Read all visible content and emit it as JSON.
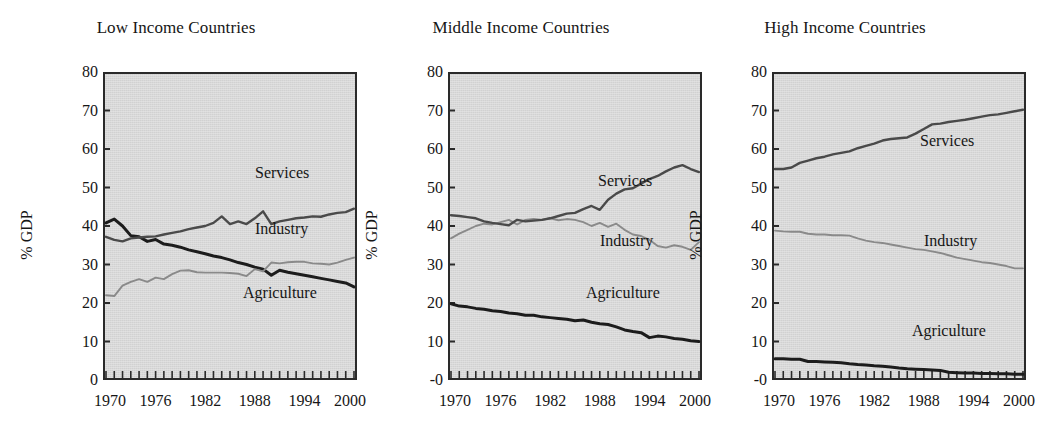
{
  "figure": {
    "ylabel": "% GDP",
    "xticks": [
      "1970",
      "1976",
      "1982",
      "1988",
      "1994",
      "2000"
    ],
    "series_colors": {
      "agriculture": "#1c1c1c",
      "industry": "#8a8a8a",
      "services": "#4a4a4a"
    },
    "plot_background": "#d9d9d9",
    "axis_color": "#2a2a2a"
  },
  "chart_data": [
    {
      "type": "line",
      "title": "Low Income Countries",
      "xlabel": "",
      "ylabel": "% GDP",
      "ylim": [
        0,
        80
      ],
      "yticks": [
        0,
        10,
        20,
        30,
        40,
        50,
        60,
        70,
        80
      ],
      "ytick_labels": [
        "0",
        "10",
        "20",
        "30",
        "40",
        "50",
        "60",
        "70",
        "80"
      ],
      "xlim": [
        1970,
        2000
      ],
      "xticks": [
        1970,
        1976,
        1982,
        1988,
        1994,
        2000
      ],
      "grid": false,
      "legend": "inline-annotations",
      "x": [
        1970,
        1971,
        1972,
        1973,
        1974,
        1975,
        1976,
        1977,
        1978,
        1979,
        1980,
        1981,
        1982,
        1983,
        1984,
        1985,
        1986,
        1987,
        1988,
        1989,
        1990,
        1991,
        1992,
        1993,
        1994,
        1995,
        1996,
        1997,
        1998,
        1999,
        2000
      ],
      "series": [
        {
          "name": "Agriculture",
          "label_x": 2000,
          "values": [
            40.8,
            41.8,
            40.0,
            37.5,
            37.2,
            36.0,
            36.5,
            35.3,
            35.0,
            34.5,
            33.8,
            33.3,
            32.8,
            32.2,
            31.8,
            31.2,
            30.5,
            30.0,
            29.3,
            28.8,
            27.2,
            28.5,
            28.0,
            27.6,
            27.2,
            26.8,
            26.4,
            26.0,
            25.6,
            25.2,
            24.2
          ]
        },
        {
          "name": "Industry",
          "label_x": 2000,
          "values": [
            22.0,
            21.8,
            24.5,
            25.5,
            26.2,
            25.5,
            26.6,
            26.2,
            27.5,
            28.4,
            28.5,
            28.0,
            27.9,
            27.9,
            27.9,
            27.8,
            27.6,
            27.0,
            28.8,
            28.2,
            30.5,
            30.3,
            30.6,
            30.7,
            30.7,
            30.3,
            30.2,
            30.0,
            30.5,
            31.2,
            31.8
          ]
        },
        {
          "name": "Services",
          "label_x": 2000,
          "values": [
            37.2,
            36.4,
            36.0,
            36.8,
            37.0,
            37.2,
            37.3,
            37.8,
            38.2,
            38.6,
            39.2,
            39.6,
            40.0,
            40.8,
            42.5,
            40.5,
            41.2,
            40.5,
            42.0,
            43.8,
            40.5,
            41.2,
            41.6,
            42.0,
            42.2,
            42.5,
            42.4,
            43.0,
            43.4,
            43.6,
            44.5
          ]
        }
      ]
    },
    {
      "type": "line",
      "title": "Middle Income Countries",
      "xlabel": "",
      "ylabel": "% GDP",
      "ylim": [
        0,
        80
      ],
      "yticks": [
        0,
        10,
        20,
        30,
        40,
        50,
        60,
        70,
        80
      ],
      "ytick_labels": [
        "-0",
        "10",
        "20",
        "30",
        "40",
        "50",
        "60",
        "70",
        "80"
      ],
      "xlim": [
        1970,
        2000
      ],
      "xticks": [
        1970,
        1976,
        1982,
        1988,
        1994,
        2000
      ],
      "grid": false,
      "legend": "inline-annotations",
      "x": [
        1970,
        1971,
        1972,
        1973,
        1974,
        1975,
        1976,
        1977,
        1978,
        1979,
        1980,
        1981,
        1982,
        1983,
        1984,
        1985,
        1986,
        1987,
        1988,
        1989,
        1990,
        1991,
        1992,
        1993,
        1994,
        1995,
        1996,
        1997,
        1998,
        1999,
        2000
      ],
      "series": [
        {
          "name": "Agriculture",
          "label_x": 2000,
          "values": [
            19.8,
            19.2,
            19.0,
            18.6,
            18.4,
            18.0,
            17.8,
            17.4,
            17.2,
            16.8,
            16.8,
            16.4,
            16.2,
            16.0,
            15.8,
            15.4,
            15.6,
            15.0,
            14.6,
            14.4,
            13.8,
            13.0,
            12.6,
            12.3,
            11.0,
            11.4,
            11.2,
            10.8,
            10.6,
            10.2,
            10.0
          ]
        },
        {
          "name": "Industry",
          "label_x": 2000,
          "values": [
            36.8,
            38.0,
            39.0,
            40.0,
            40.6,
            40.4,
            41.0,
            41.6,
            40.4,
            41.6,
            41.8,
            41.6,
            42.0,
            41.5,
            41.8,
            41.6,
            41.0,
            40.0,
            40.8,
            39.8,
            40.6,
            39.0,
            37.8,
            37.4,
            36.4,
            34.8,
            34.4,
            35.0,
            34.6,
            33.8,
            35.8
          ]
        },
        {
          "name": "Services",
          "label_x": 2000,
          "values": [
            42.8,
            42.6,
            42.3,
            42.0,
            41.2,
            40.8,
            40.5,
            40.2,
            41.6,
            41.2,
            41.4,
            41.6,
            42.0,
            42.6,
            43.2,
            43.4,
            44.4,
            45.2,
            44.2,
            46.8,
            48.4,
            49.5,
            49.8,
            51.0,
            52.2,
            53.0,
            54.2,
            55.2,
            55.8,
            54.8,
            54.0
          ]
        }
      ]
    },
    {
      "type": "line",
      "title": "High Income Countries",
      "xlabel": "",
      "ylabel": "% GDP",
      "ylim": [
        0,
        80
      ],
      "yticks": [
        0,
        10,
        20,
        30,
        40,
        50,
        60,
        70,
        80
      ],
      "ytick_labels": [
        "-0",
        "10",
        "20",
        "30",
        "40",
        "50",
        "60",
        "70",
        "80"
      ],
      "xlim": [
        1970,
        2000
      ],
      "xticks": [
        1970,
        1976,
        1982,
        1988,
        1994,
        2000
      ],
      "grid": false,
      "legend": "inline-annotations",
      "x": [
        1970,
        1971,
        1972,
        1973,
        1974,
        1975,
        1976,
        1977,
        1978,
        1979,
        1980,
        1981,
        1982,
        1983,
        1984,
        1985,
        1986,
        1987,
        1988,
        1989,
        1990,
        1991,
        1992,
        1993,
        1994,
        1995,
        1996,
        1997,
        1998,
        1999,
        2000
      ],
      "series": [
        {
          "name": "Agriculture",
          "label_x": 2000,
          "values": [
            5.5,
            5.5,
            5.4,
            5.4,
            4.8,
            4.8,
            4.7,
            4.6,
            4.5,
            4.2,
            4.0,
            3.9,
            3.7,
            3.6,
            3.4,
            3.1,
            2.9,
            2.8,
            2.7,
            2.6,
            2.5,
            2.0,
            1.9,
            1.8,
            1.8,
            1.7,
            1.7,
            1.6,
            1.6,
            1.5,
            1.5
          ]
        },
        {
          "name": "Industry",
          "label_x": 2000,
          "values": [
            38.8,
            38.6,
            38.5,
            38.5,
            38.0,
            37.8,
            37.8,
            37.6,
            37.6,
            37.5,
            36.8,
            36.2,
            35.8,
            35.6,
            35.2,
            34.8,
            34.4,
            34.0,
            33.8,
            33.4,
            33.0,
            32.4,
            31.8,
            31.4,
            31.0,
            30.6,
            30.4,
            30.0,
            29.6,
            29.0,
            29.0
          ]
        },
        {
          "name": "Services",
          "label_x": 2000,
          "values": [
            54.8,
            54.8,
            55.2,
            56.4,
            57.0,
            57.6,
            58.0,
            58.6,
            59.0,
            59.4,
            60.2,
            60.8,
            61.4,
            62.2,
            62.6,
            62.8,
            63.0,
            64.0,
            65.2,
            66.4,
            66.6,
            67.0,
            67.3,
            67.6,
            68.0,
            68.4,
            68.8,
            69.0,
            69.4,
            69.8,
            70.2
          ]
        }
      ]
    }
  ]
}
